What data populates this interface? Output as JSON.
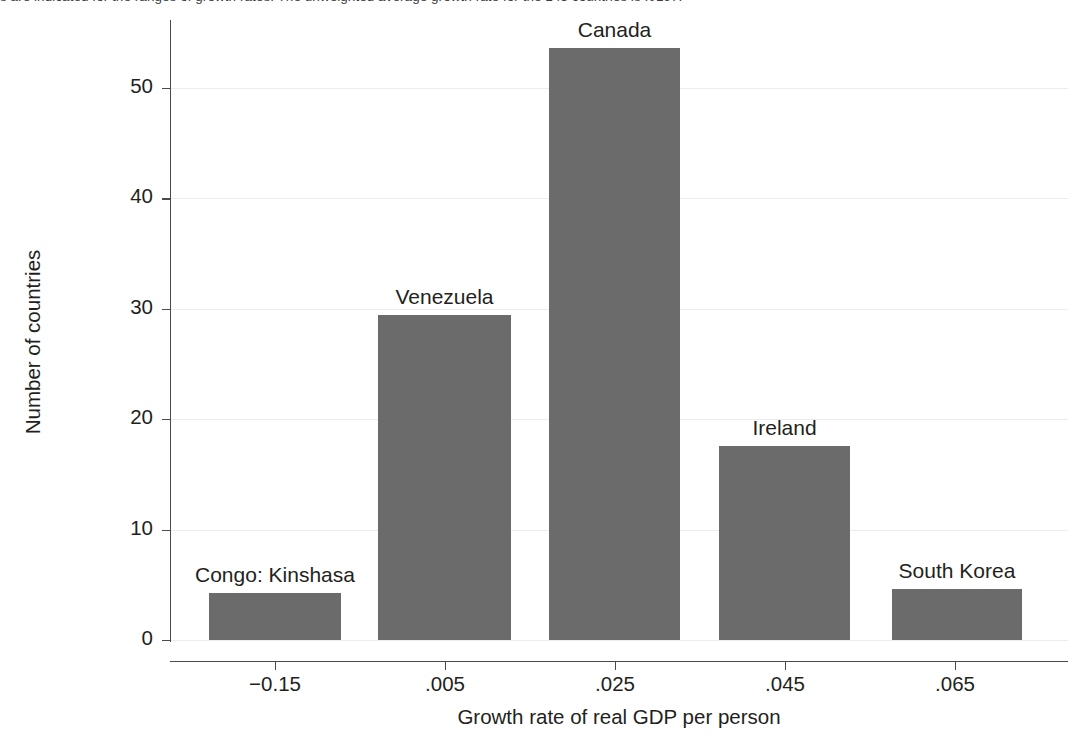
{
  "caption": {
    "text_fragment": "s are indicated for the ranges of growth rates. The unweighted average growth rate for the 143 countries is .0197."
  },
  "chart_data": {
    "type": "bar",
    "title": "",
    "xlabel": "Growth rate of real GDP per person",
    "ylabel": "Number of countries",
    "categories": [
      "-0.15",
      ".005",
      ".025",
      ".045",
      ".065"
    ],
    "values": [
      4.3,
      29.4,
      53.6,
      17.6,
      4.6
    ],
    "bar_annotations": [
      "Congo: Kinshasa",
      "Venezuela",
      "Canada",
      "Ireland",
      "South Korea"
    ],
    "xtick_labels": [
      "−0.15",
      ".005",
      ".025",
      ".045",
      ".065"
    ],
    "ytick_labels": [
      "0",
      "10",
      "20",
      "30",
      "40",
      "50"
    ],
    "ytick_values": [
      0,
      10,
      20,
      30,
      40,
      50
    ],
    "ylim": [
      0,
      56
    ],
    "grid": "horizontal",
    "legend": "none",
    "bar_color": "#6b6b6b",
    "grid_color": "#ececec",
    "axis_color": "#4a4a4a"
  },
  "geometry": {
    "y_zero_px": 640,
    "y_unit_px": 11.04,
    "bars_px": [
      {
        "left": 209,
        "right": 341
      },
      {
        "left": 378,
        "right": 511
      },
      {
        "left": 549,
        "right": 680
      },
      {
        "left": 719,
        "right": 850
      },
      {
        "left": 892,
        "right": 1022
      }
    ],
    "xticks_px": [
      275,
      445,
      615,
      785,
      955
    ],
    "label_offset_px": 30
  }
}
